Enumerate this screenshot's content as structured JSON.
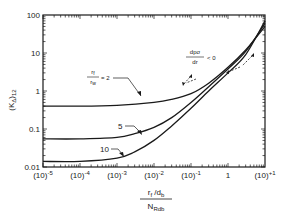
{
  "chart_data": {
    "type": "line",
    "title": "",
    "xlabel_numerator": "r_f / d_b",
    "xlabel_denominator": "N_Rdb",
    "ylabel": "(K_Δ)_12",
    "x_scale": "log",
    "y_scale": "log",
    "xlim": [
      1e-05,
      10
    ],
    "ylim": [
      0.01,
      100
    ],
    "x_ticks": [
      "(10)^-5",
      "(10)^-4",
      "(10)^-3",
      "(10)^-2",
      "(10)^-1",
      "1",
      "(10)^+1"
    ],
    "y_ticks": [
      "0.01",
      "0.1",
      "1",
      "10",
      "100"
    ],
    "grid": false,
    "legend": "none",
    "series": [
      {
        "name": "r_f/r_w = 2",
        "x": [
          1e-05,
          0.0001,
          0.001,
          0.01,
          0.03,
          0.1,
          0.3,
          1,
          3,
          10
        ],
        "y": [
          0.4,
          0.4,
          0.42,
          0.5,
          0.6,
          0.85,
          1.6,
          4.2,
          12,
          50
        ]
      },
      {
        "name": "5",
        "x": [
          1e-05,
          0.0001,
          0.001,
          0.003,
          0.01,
          0.03,
          0.1,
          0.3,
          1,
          3,
          10
        ],
        "y": [
          0.055,
          0.055,
          0.06,
          0.075,
          0.11,
          0.2,
          0.5,
          1.3,
          3.8,
          11,
          60
        ]
      },
      {
        "name": "10",
        "x": [
          1e-05,
          0.0001,
          0.001,
          0.003,
          0.01,
          0.03,
          0.1,
          0.3,
          1,
          3,
          10
        ],
        "y": [
          0.014,
          0.014,
          0.017,
          0.025,
          0.05,
          0.12,
          0.35,
          1.0,
          3.0,
          9,
          70
        ]
      }
    ],
    "annotations": [
      {
        "text": "r_f / r_w = 2",
        "target_series": "r_f/r_w = 2"
      },
      {
        "text": "5",
        "target_series": "5"
      },
      {
        "text": "10",
        "target_series": "10"
      },
      {
        "text": "dpσ/dr < 0",
        "style": "dashed arrows"
      }
    ]
  },
  "labels": {
    "y_ticks": [
      "100",
      "10",
      "1",
      "0.1",
      "0.01"
    ],
    "x_ticks": [
      {
        "base": "(10)",
        "exp": "-5"
      },
      {
        "base": "(10)",
        "exp": "-4"
      },
      {
        "base": "(10)",
        "exp": "-3"
      },
      {
        "base": "(10)",
        "exp": "-2"
      },
      {
        "base": "(10)",
        "exp": "-1"
      },
      {
        "base": "1",
        "exp": ""
      },
      {
        "base": "(10)",
        "exp": "+1"
      }
    ],
    "ylabel_main": "(K",
    "ylabel_sub_delta": "Δ",
    "ylabel_close": ")",
    "ylabel_sub": "12",
    "xlabel_num_main": "r",
    "xlabel_num_sub": "f",
    "xlabel_num_rest": " /d",
    "xlabel_num_sub2": "b",
    "xlabel_den_main": "N",
    "xlabel_den_sub": "Rdb",
    "ann_ratio_num": "r",
    "ann_ratio_num_sub": "f",
    "ann_ratio_den": "r",
    "ann_ratio_den_sub": "w",
    "ann_ratio_eq": "= 2",
    "ann_5": "5",
    "ann_10": "10",
    "ann_dp_num": "dpσ",
    "ann_dp_den": "dr",
    "ann_dp_lt": "< 0"
  }
}
